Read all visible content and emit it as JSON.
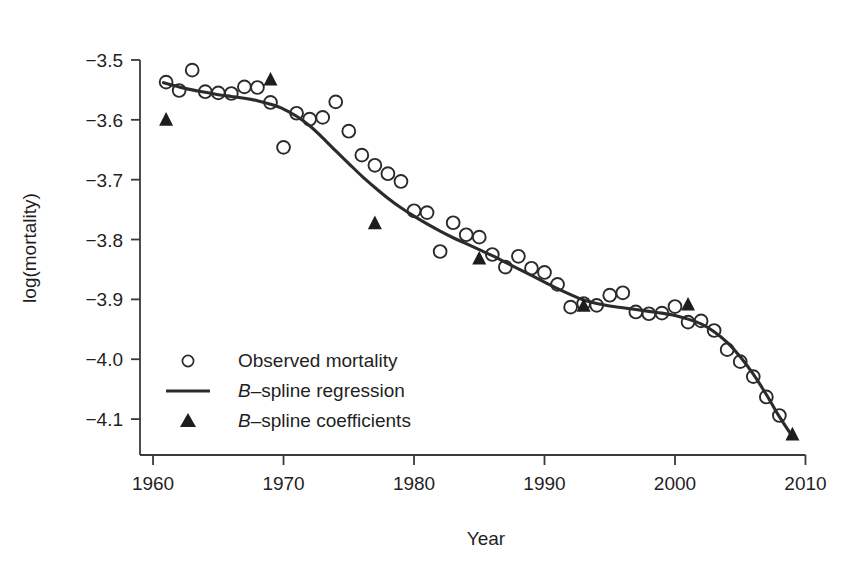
{
  "chart_data": {
    "type": "scatter",
    "title": "",
    "xlabel": "Year",
    "ylabel": "log(mortality)",
    "xlim": [
      1959.0,
      2010.5
    ],
    "ylim": [
      -4.16,
      -3.47
    ],
    "xticks": [
      1960,
      1970,
      1980,
      1990,
      2000,
      2010
    ],
    "xtick_labels": [
      "1960",
      "1970",
      "1980",
      "1990",
      "2000",
      "2010"
    ],
    "yticks": [
      -3.5,
      -3.6,
      -3.7,
      -3.8,
      -3.9,
      -4.0,
      -4.1
    ],
    "ytick_labels": [
      "−3.5",
      "−3.6",
      "−3.7",
      "−3.8",
      "−3.9",
      "−4.0",
      "−4.1"
    ],
    "grid": false,
    "legend_position": "lower-left-inside",
    "series": [
      {
        "name": "Observed mortality",
        "marker": "open-circle",
        "type": "scatter",
        "x": [
          1961,
          1962,
          1963,
          1964,
          1965,
          1966,
          1967,
          1968,
          1969,
          1970,
          1971,
          1972,
          1973,
          1974,
          1975,
          1976,
          1977,
          1978,
          1979,
          1980,
          1981,
          1982,
          1983,
          1984,
          1985,
          1986,
          1987,
          1988,
          1989,
          1990,
          1991,
          1992,
          1993,
          1994,
          1995,
          1996,
          1997,
          1998,
          1999,
          2000,
          2001,
          2002,
          2003,
          2004,
          2005,
          2006,
          2007,
          2008
        ],
        "y": [
          -3.537,
          -3.551,
          -3.517,
          -3.553,
          -3.555,
          -3.556,
          -3.545,
          -3.546,
          -3.571,
          -3.646,
          -3.589,
          -3.599,
          -3.596,
          -3.57,
          -3.619,
          -3.659,
          -3.676,
          -3.69,
          -3.703,
          -3.752,
          -3.755,
          -3.82,
          -3.772,
          -3.792,
          -3.796,
          -3.825,
          -3.846,
          -3.828,
          -3.848,
          -3.855,
          -3.875,
          -3.913,
          -3.907,
          -3.91,
          -3.893,
          -3.889,
          -3.921,
          -3.924,
          -3.923,
          -3.912,
          -3.938,
          -3.936,
          -3.952,
          -3.984,
          -4.004,
          -4.029,
          -4.063,
          -4.094
        ]
      },
      {
        "name": "B–spline regression",
        "marker": "line",
        "type": "line",
        "x": [
          1960.8,
          1962,
          1963,
          1964,
          1965,
          1966,
          1967,
          1968,
          1969,
          1970,
          1971,
          1972,
          1973,
          1974,
          1975,
          1976,
          1977,
          1978,
          1979,
          1980,
          1981,
          1982,
          1983,
          1984,
          1985,
          1986,
          1987,
          1988,
          1989,
          1990,
          1991,
          1992,
          1993,
          1994,
          1995,
          1996,
          1997,
          1998,
          1999,
          2000,
          2001,
          2002,
          2003,
          2004,
          2005,
          2006,
          2007,
          2008,
          2008.9
        ],
        "y": [
          -3.538,
          -3.545,
          -3.55,
          -3.554,
          -3.558,
          -3.561,
          -3.564,
          -3.568,
          -3.574,
          -3.582,
          -3.594,
          -3.61,
          -3.63,
          -3.652,
          -3.673,
          -3.694,
          -3.713,
          -3.731,
          -3.747,
          -3.761,
          -3.774,
          -3.786,
          -3.797,
          -3.807,
          -3.817,
          -3.827,
          -3.838,
          -3.849,
          -3.86,
          -3.871,
          -3.882,
          -3.892,
          -3.901,
          -3.907,
          -3.911,
          -3.914,
          -3.917,
          -3.92,
          -3.923,
          -3.927,
          -3.933,
          -3.941,
          -3.954,
          -3.972,
          -3.996,
          -4.025,
          -4.059,
          -4.096,
          -4.126
        ]
      },
      {
        "name": "B–spline coefficients",
        "marker": "filled-triangle",
        "type": "scatter",
        "x": [
          1961,
          1969,
          1977,
          1985,
          1993,
          2001,
          2009
        ],
        "y": [
          -3.6,
          -3.533,
          -3.773,
          -3.832,
          -3.911,
          -3.909,
          -4.126
        ]
      }
    ]
  },
  "legend": {
    "items": [
      {
        "marker": "open-circle",
        "label_plain": "Observed mortality",
        "label_prefix": "",
        "label_rest": "Observed mortality"
      },
      {
        "marker": "line",
        "label_plain": "B–spline regression",
        "label_prefix": "B",
        "label_rest": "–spline regression"
      },
      {
        "marker": "filled-triangle",
        "label_plain": "B–spline coefficients",
        "label_prefix": "B",
        "label_rest": "–spline coefficients"
      }
    ]
  },
  "colors": {
    "background": "#ffffff",
    "axis": "#3a3a3a",
    "line": "#2b2b2b",
    "marker": "#2b2b2b",
    "coefficient": "#1d1d1d",
    "text": "#1f1f1f"
  }
}
